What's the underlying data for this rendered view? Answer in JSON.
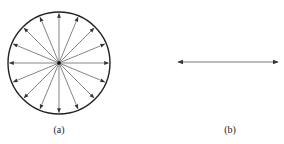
{
  "figure": {
    "panel_a": {
      "label": "(a)",
      "description": "circle with arrows radiating from center in all directions",
      "center": [
        59,
        63
      ],
      "radius": 51,
      "arrow_count": 16
    },
    "panel_b": {
      "label": "(b)",
      "description": "horizontal double-headed arrow",
      "x1": 178,
      "x2": 278,
      "y": 62
    },
    "colors": {
      "stroke": "#222222",
      "arrow": "#555555"
    }
  }
}
